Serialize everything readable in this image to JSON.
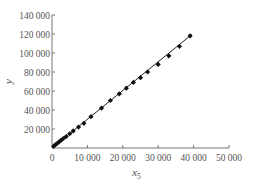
{
  "chart_data": {
    "type": "scatter",
    "title": "",
    "xlabel": "x",
    "xlabel_sub": "5",
    "ylabel": "y",
    "xlim": [
      0,
      50000
    ],
    "ylim": [
      0,
      140000
    ],
    "x_ticks": [
      0,
      10000,
      20000,
      30000,
      40000,
      50000
    ],
    "x_tick_labels": [
      "0",
      "10 000",
      "20 000",
      "30 000",
      "40 000",
      "50 000"
    ],
    "y_ticks": [
      20000,
      40000,
      60000,
      80000,
      100000,
      120000,
      140000
    ],
    "y_tick_labels": [
      "20 000",
      "40 000",
      "60 000",
      "80 000",
      "100 000",
      "120 000",
      "140 000"
    ],
    "grid": false,
    "legend": null,
    "series": [
      {
        "name": "observed",
        "marker": "diamond",
        "color": "#111111",
        "x": [
          500,
          1000,
          1500,
          2000,
          2500,
          3200,
          4000,
          5000,
          6000,
          7500,
          9000,
          11000,
          14000,
          16500,
          19000,
          21000,
          23000,
          25000,
          27000,
          30000,
          33000,
          36000,
          39000
        ],
        "y": [
          2000,
          3500,
          5000,
          6500,
          8000,
          10000,
          12000,
          15000,
          18000,
          22000,
          26000,
          33000,
          42000,
          50000,
          57000,
          63000,
          69000,
          74000,
          80000,
          88000,
          97000,
          107000,
          118000
        ]
      }
    ],
    "fit_line": {
      "name": "fitted line",
      "color": "#222222",
      "x": [
        0,
        39500
      ],
      "y": [
        0,
        119500
      ]
    }
  }
}
